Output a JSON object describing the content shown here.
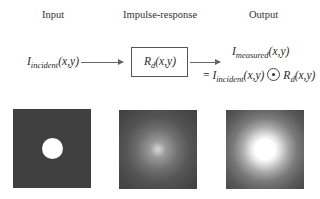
{
  "headers": {
    "input": "Input",
    "impulse": "Impulse-response",
    "output": "Output"
  },
  "equations": {
    "incident_base": "I",
    "incident_sub": "incident",
    "incident_args": "(x,y)",
    "response_base": "R",
    "response_sub": "d",
    "response_args": "(x,y)",
    "measured_base": "I",
    "measured_sub": "measured",
    "measured_args": "(x,y)",
    "equals": "= ",
    "conv_symbol": "convolution-operator"
  },
  "images": [
    {
      "label": "input-image",
      "description": "dark square with bright white disk in center"
    },
    {
      "label": "impulse-response-image",
      "description": "dark square with faint diffuse glow in center"
    },
    {
      "label": "output-image",
      "description": "dark square with bright blurred disk in center"
    }
  ]
}
